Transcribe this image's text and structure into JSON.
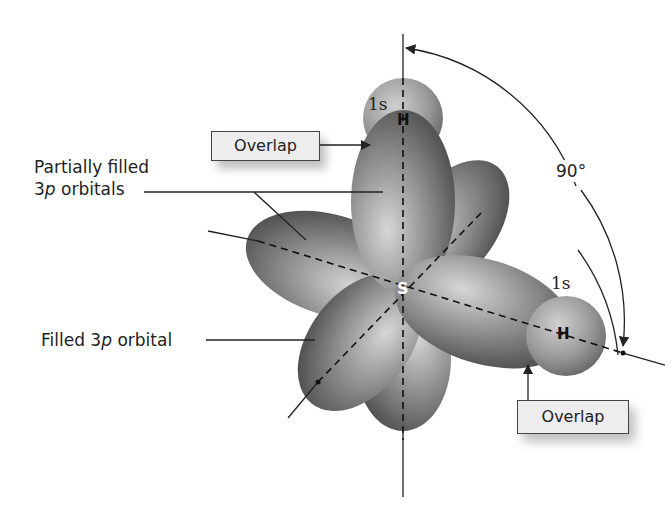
{
  "diagram": {
    "central_atom": "S",
    "atoms": [
      {
        "symbol": "H",
        "orbital": "1s",
        "position": "top"
      },
      {
        "symbol": "H",
        "orbital": "1s",
        "position": "right"
      }
    ],
    "labels": {
      "partially_filled_line1": "Partially filled",
      "partially_filled_line2_num": "3",
      "partially_filled_line2_italic": "p",
      "partially_filled_line2_rest": " orbitals",
      "filled_prefix": "Filled 3",
      "filled_italic": "p",
      "filled_suffix": " orbital",
      "overlap_top": "Overlap",
      "overlap_bottom": "Overlap",
      "angle": "90°",
      "orbital_top": "1s",
      "orbital_right": "1s",
      "atom_top": "H",
      "atom_right": "H",
      "center": "S"
    },
    "colors": {
      "lobe_light": "#c8c8c8",
      "lobe_dark": "#4a4a4a",
      "line": "#222222",
      "box_fill": "#ededed"
    }
  }
}
